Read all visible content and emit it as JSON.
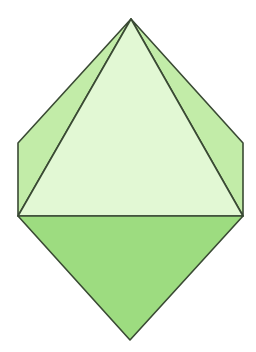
{
  "diagram": {
    "title": "",
    "colors": {
      "background": "#ffffff",
      "front_face": "#e2f8d4",
      "side_faces": "#c2eca8",
      "bottom_face": "#9ddc80",
      "edge": "#3a4a34"
    },
    "vertices": {
      "top_apex": [
        131,
        19
      ],
      "left_top": [
        18,
        143
      ],
      "left_bottom": [
        18,
        216
      ],
      "right_top": [
        243,
        143
      ],
      "right_bottom": [
        243,
        216
      ],
      "bottom_apex": [
        130,
        340
      ]
    }
  }
}
